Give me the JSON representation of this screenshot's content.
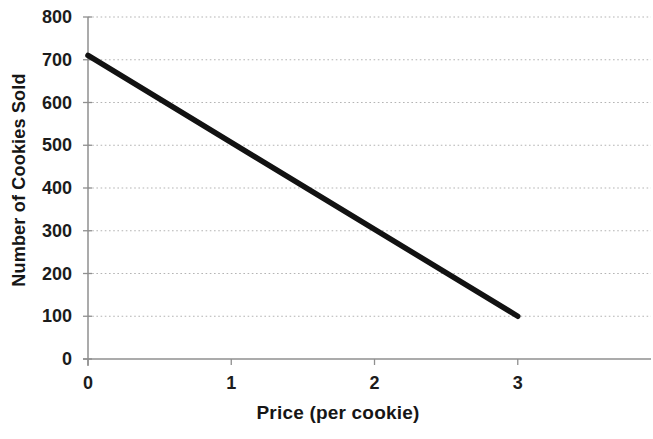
{
  "chart_data": {
    "type": "line",
    "title": "",
    "xlabel": "Price (per cookie)",
    "ylabel": "Number of Cookies Sold",
    "x_ticks": [
      0,
      1,
      2,
      3
    ],
    "y_ticks": [
      0,
      100,
      200,
      300,
      400,
      500,
      600,
      700,
      800
    ],
    "xlim": [
      0,
      3.93
    ],
    "ylim": [
      0,
      800
    ],
    "grid": "horizontal-dotted",
    "legend": "none",
    "series": [
      {
        "points": [
          {
            "x": 0,
            "y": 710
          },
          {
            "x": 3,
            "y": 100
          }
        ],
        "color": "#121212"
      }
    ]
  },
  "colors": {
    "background": "#ffffff",
    "line": "#121212",
    "gridline": "#b4b4b4",
    "axis": "#8f8f8f",
    "text": "#1c1c1c"
  }
}
